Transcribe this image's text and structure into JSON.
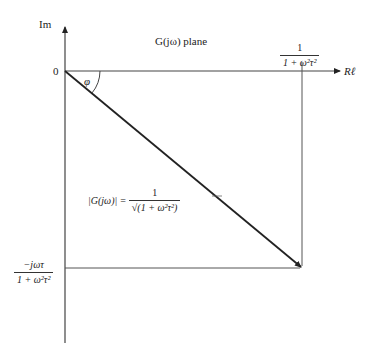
{
  "diagram": {
    "title": "G(jω) plane",
    "axes": {
      "imag_label": "Im",
      "real_label": "Rℓ",
      "origin_label": "0"
    },
    "angle_label": "φ",
    "real_projection": {
      "numerator": "1",
      "denominator": "1 + ω²τ²"
    },
    "imag_projection": {
      "numerator": "−jωτ",
      "denominator": "1 + ω²τ²"
    },
    "magnitude": {
      "lhs": "|G(jω)|",
      "equals": "=",
      "numerator": "1",
      "denominator": "√(1 + ω²τ²)"
    },
    "colors": {
      "line": "#222222",
      "guide": "#555555",
      "background": "#ffffff"
    }
  }
}
